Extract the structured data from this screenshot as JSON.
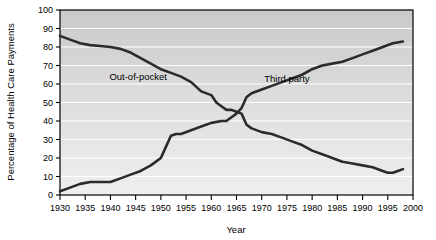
{
  "chart_data": {
    "type": "line",
    "title": "",
    "xlabel": "Year",
    "ylabel": "Percentage of Health Care Payments",
    "xlim": [
      1930,
      2000
    ],
    "ylim": [
      0,
      100
    ],
    "grid": true,
    "grid_orientation": "horizontal",
    "legend_position": "inline-annotation",
    "x_ticks": [
      1930,
      1935,
      1940,
      1945,
      1950,
      1955,
      1960,
      1965,
      1970,
      1975,
      1980,
      1985,
      1990,
      1995,
      2000
    ],
    "x_tick_labels": [
      "1930",
      "1935",
      "1940",
      "1945",
      "1950",
      "1955",
      "1960",
      "1965",
      "1970",
      "1975",
      "1980",
      "1985",
      "1990",
      "1995",
      "2000"
    ],
    "y_ticks": [
      0,
      10,
      20,
      30,
      40,
      50,
      60,
      70,
      80,
      90,
      100
    ],
    "y_tick_labels": [
      "0",
      "10",
      "20",
      "30",
      "40",
      "50",
      "60",
      "70",
      "80",
      "90",
      "100"
    ],
    "series": [
      {
        "name": "Out-of-pocket",
        "label": "Out-of-pocket",
        "color": "#2b2b2b",
        "label_x": 1945.5,
        "label_y": 62,
        "points": [
          [
            1930,
            86
          ],
          [
            1932,
            84
          ],
          [
            1934,
            82
          ],
          [
            1936,
            81
          ],
          [
            1938,
            80.5
          ],
          [
            1940,
            80
          ],
          [
            1942,
            79
          ],
          [
            1944,
            77
          ],
          [
            1946,
            74
          ],
          [
            1948,
            71
          ],
          [
            1950,
            68
          ],
          [
            1952,
            66
          ],
          [
            1954,
            64
          ],
          [
            1956,
            61
          ],
          [
            1958,
            56
          ],
          [
            1960,
            54
          ],
          [
            1961,
            50
          ],
          [
            1962,
            48
          ],
          [
            1963,
            46
          ],
          [
            1964,
            46
          ],
          [
            1965,
            45
          ],
          [
            1966,
            44
          ],
          [
            1967,
            38
          ],
          [
            1968,
            36
          ],
          [
            1970,
            34
          ],
          [
            1972,
            33
          ],
          [
            1974,
            31
          ],
          [
            1976,
            29
          ],
          [
            1978,
            27
          ],
          [
            1980,
            24
          ],
          [
            1982,
            22
          ],
          [
            1984,
            20
          ],
          [
            1986,
            18
          ],
          [
            1988,
            17
          ],
          [
            1990,
            16
          ],
          [
            1992,
            15
          ],
          [
            1994,
            13
          ],
          [
            1995,
            12
          ],
          [
            1996,
            12
          ],
          [
            1997,
            13
          ],
          [
            1998,
            14
          ]
        ]
      },
      {
        "name": "Third party",
        "label": "Third party",
        "color": "#2b2b2b",
        "label_x": 1975,
        "label_y": 61,
        "points": [
          [
            1930,
            2
          ],
          [
            1932,
            4
          ],
          [
            1934,
            6
          ],
          [
            1936,
            7
          ],
          [
            1938,
            7
          ],
          [
            1940,
            7
          ],
          [
            1942,
            9
          ],
          [
            1944,
            11
          ],
          [
            1946,
            13
          ],
          [
            1948,
            16
          ],
          [
            1950,
            20
          ],
          [
            1951,
            26
          ],
          [
            1952,
            32
          ],
          [
            1953,
            33
          ],
          [
            1954,
            33
          ],
          [
            1956,
            35
          ],
          [
            1958,
            37
          ],
          [
            1960,
            39
          ],
          [
            1962,
            40
          ],
          [
            1963,
            40
          ],
          [
            1964,
            42
          ],
          [
            1965,
            44
          ],
          [
            1966,
            47
          ],
          [
            1967,
            53
          ],
          [
            1968,
            55
          ],
          [
            1970,
            57
          ],
          [
            1972,
            59
          ],
          [
            1974,
            61
          ],
          [
            1976,
            63
          ],
          [
            1978,
            65
          ],
          [
            1980,
            68
          ],
          [
            1982,
            70
          ],
          [
            1984,
            71
          ],
          [
            1986,
            72
          ],
          [
            1988,
            74
          ],
          [
            1990,
            76
          ],
          [
            1992,
            78
          ],
          [
            1994,
            80
          ],
          [
            1996,
            82
          ],
          [
            1998,
            83
          ]
        ]
      }
    ]
  }
}
